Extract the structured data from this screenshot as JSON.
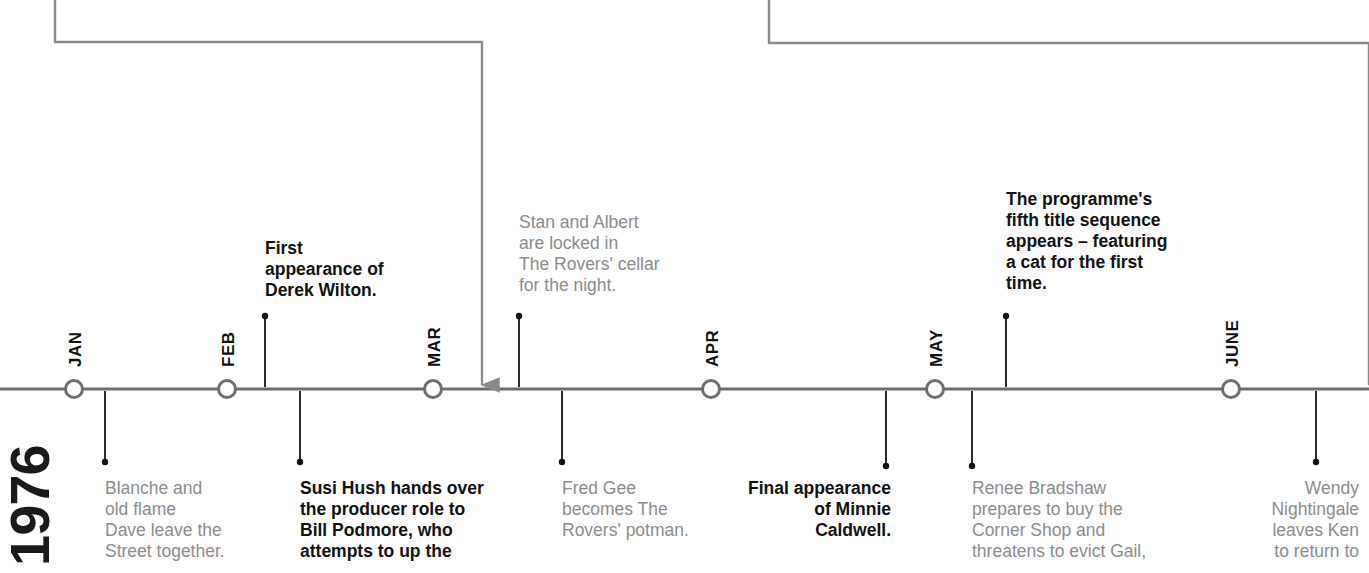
{
  "year": "1976",
  "colors": {
    "axis": "#6e6e6e",
    "grey_text": "#8d8d8d",
    "bold_text": "#111111",
    "connector": "#8a8a8a"
  },
  "axis": {
    "y": 389,
    "x_start": 0,
    "x_end": 1369
  },
  "months": [
    {
      "label": "JAN",
      "x": 74
    },
    {
      "label": "FEB",
      "x": 227
    },
    {
      "label": "MAR",
      "x": 433
    },
    {
      "label": "APR",
      "x": 711
    },
    {
      "label": "MAY",
      "x": 935
    },
    {
      "label": "JUNE",
      "x": 1231
    }
  ],
  "connectors": [
    {
      "name": "connector-left",
      "start_x": 55,
      "corner_y": 42,
      "end_x": 482,
      "arrow_y": 385
    },
    {
      "name": "connector-right",
      "start_x": 769,
      "corner_y": 43,
      "end_x": 1369,
      "arrow_y": 385,
      "offscreen": true
    }
  ],
  "events_above": [
    {
      "id": "derek-wilton",
      "style": "bold",
      "align": "left",
      "stem_x": 265,
      "stem_top": 316,
      "text_x": 265,
      "text_y": 238,
      "width": 160,
      "text": "First\nappearance of\nDerek Wilton."
    },
    {
      "id": "stan-albert",
      "style": "grey",
      "align": "left",
      "stem_x": 519,
      "stem_top": 316,
      "text_x": 519,
      "text_y": 212,
      "width": 170,
      "text": "Stan and Albert\nare locked in\nThe Rovers' cellar\nfor the night."
    },
    {
      "id": "fifth-title-sequence",
      "style": "bold",
      "align": "left",
      "stem_x": 1006,
      "stem_top": 316,
      "text_x": 1006,
      "text_y": 189,
      "width": 190,
      "text": "The programme's\nfifth title sequence\nappears – featuring\na cat for the first\ntime."
    }
  ],
  "events_below": [
    {
      "id": "blanche-dave",
      "style": "grey",
      "align": "left",
      "stem_x": 105,
      "stem_bottom": 462,
      "text_x": 105,
      "text_y": 478,
      "width": 170,
      "text": "Blanche and\nold flame\nDave leave the\nStreet together."
    },
    {
      "id": "susi-hush",
      "style": "bold",
      "align": "left",
      "stem_x": 300,
      "stem_bottom": 462,
      "text_x": 300,
      "text_y": 478,
      "width": 200,
      "text": "Susi Hush hands over\nthe producer role to\nBill Podmore, who\nattempts to up the"
    },
    {
      "id": "fred-gee",
      "style": "grey",
      "align": "left",
      "stem_x": 562,
      "stem_bottom": 462,
      "text_x": 562,
      "text_y": 478,
      "width": 150,
      "text": "Fred Gee\nbecomes The\nRovers' potman."
    },
    {
      "id": "minnie-caldwell",
      "style": "bold",
      "align": "right",
      "stem_x": 886,
      "stem_bottom": 466,
      "text_x": 731,
      "text_y": 478,
      "width": 160,
      "text": "Final appearance\nof Minnie\nCaldwell."
    },
    {
      "id": "renee-bradshaw",
      "style": "grey",
      "align": "left",
      "stem_x": 972,
      "stem_bottom": 466,
      "text_x": 972,
      "text_y": 478,
      "width": 200,
      "text": "Renee Bradshaw\nprepares to buy the\nCorner Shop and\nthreatens to evict Gail,"
    },
    {
      "id": "wendy-nightingale",
      "style": "grey",
      "align": "right",
      "stem_x": 1316,
      "stem_bottom": 462,
      "text_x": 1219,
      "text_y": 478,
      "width": 140,
      "text": "Wendy\nNightingale\nleaves Ken\nto return to"
    }
  ]
}
